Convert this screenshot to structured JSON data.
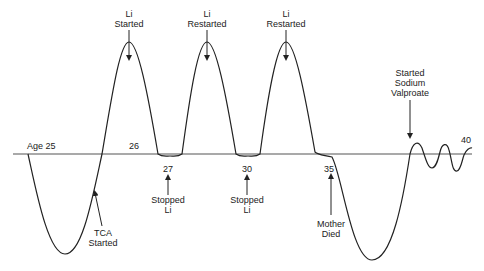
{
  "diagram": {
    "type": "mood-timeline",
    "baseline_labels": [
      {
        "text": "Age 25",
        "x": 27,
        "y": 141
      },
      {
        "text": "26",
        "x": 129,
        "y": 141
      },
      {
        "text": "40",
        "x": 461,
        "y": 135
      }
    ],
    "below_labels": [
      {
        "text": "27",
        "x": 168,
        "y": 165
      },
      {
        "text": "30",
        "x": 247,
        "y": 165
      },
      {
        "text": "35",
        "x": 329,
        "y": 165
      }
    ],
    "annotations_top": [
      {
        "line1": "Li",
        "line2": "Started",
        "x": 129
      },
      {
        "line1": "Li",
        "line2": "Restarted",
        "x": 207
      },
      {
        "line1": "Li",
        "line2": "Restarted",
        "x": 286
      }
    ],
    "annotation_valproate": {
      "line1": "Started",
      "line2": "Sodium",
      "line3": "Valproate"
    },
    "annotations_bottom": [
      {
        "line1": "Stopped",
        "line2": "Li"
      },
      {
        "line1": "Stopped",
        "line2": "Li"
      },
      {
        "line1": "Mother",
        "line2": "Died"
      },
      {
        "line1": "TCA",
        "line2": "Started"
      }
    ],
    "colors": {
      "line": "#222222",
      "axis": "#555555",
      "text": "#222222"
    }
  }
}
